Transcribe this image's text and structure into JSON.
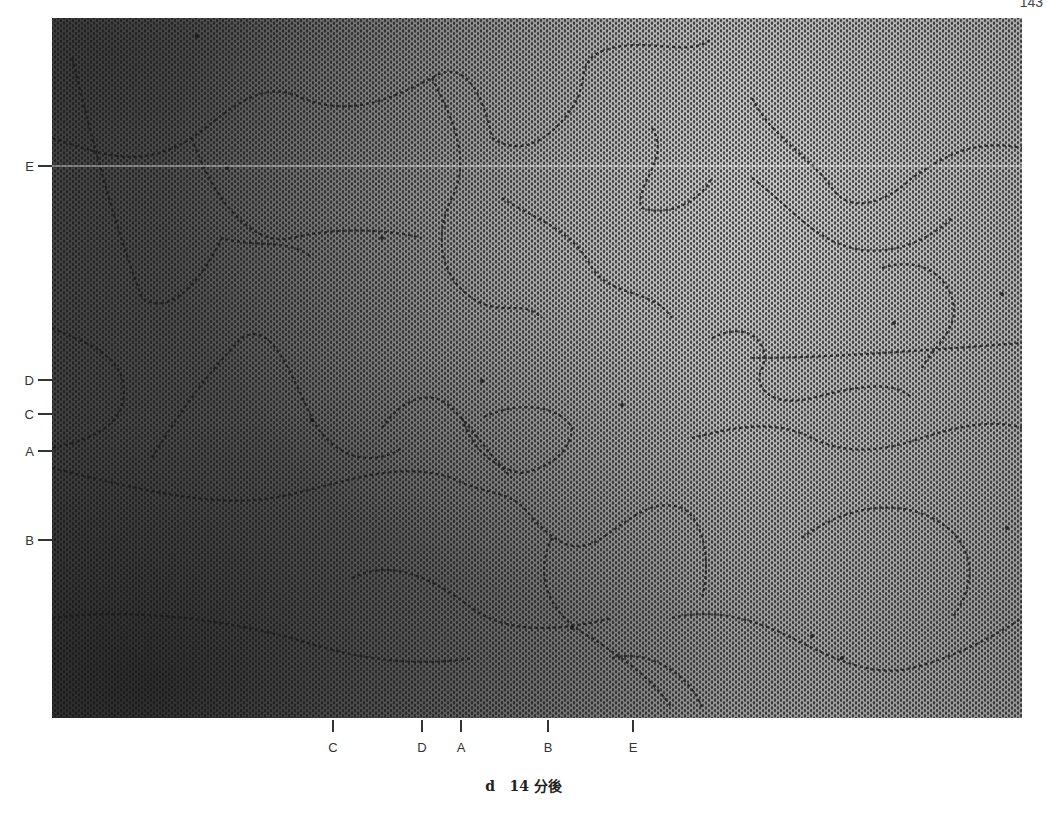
{
  "page": {
    "number": "143"
  },
  "figure": {
    "label": "d",
    "caption_time": "14 分後"
  },
  "markers": {
    "left": [
      {
        "label": "E",
        "y": 166
      },
      {
        "label": "D",
        "y": 380
      },
      {
        "label": "C",
        "y": 414
      },
      {
        "label": "A",
        "y": 451
      },
      {
        "label": "B",
        "y": 540
      }
    ],
    "bottom": [
      {
        "label": "C",
        "x": 333
      },
      {
        "label": "D",
        "x": 422
      },
      {
        "label": "A",
        "x": 461
      },
      {
        "label": "B",
        "x": 548
      },
      {
        "label": "E",
        "x": 633
      }
    ]
  },
  "colors": {
    "boundary": "#1a1a1a",
    "background": "#ffffff"
  }
}
